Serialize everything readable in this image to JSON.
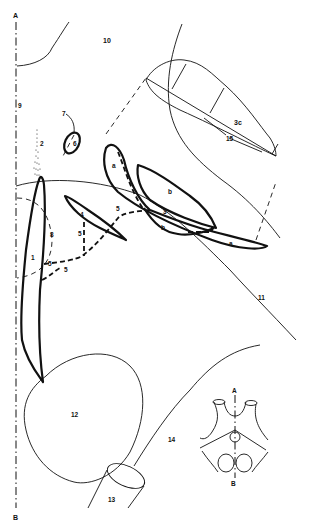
{
  "figure": {
    "axis": {
      "top_label": "A",
      "bottom_label": "B"
    },
    "labels": {
      "l1": "1",
      "l2": "2",
      "l3": "3",
      "l3c": "3c",
      "l4": "4",
      "l5a": "5",
      "l5b": "5",
      "l5c": "5",
      "l5d": "5",
      "l5e": "5",
      "l6": "6",
      "l7": "7",
      "l8": "8",
      "l9": "9",
      "l10": "10",
      "l11": "11",
      "l12": "12",
      "l13": "13",
      "l14": "14",
      "l15": "15",
      "la1": "a",
      "la2": "a",
      "lb1": "b",
      "lb2": "b"
    },
    "inset": {
      "top_label": "A",
      "bottom_label": "B"
    }
  }
}
